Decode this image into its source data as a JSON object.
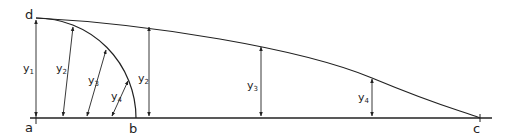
{
  "diagram": {
    "points": {
      "a": "a",
      "b": "b",
      "c": "c",
      "d": "d"
    },
    "ordinates": [
      {
        "base": "y",
        "sub": "1"
      },
      {
        "base": "y",
        "sub": "2"
      },
      {
        "base": "y",
        "sub": "3"
      },
      {
        "base": "y",
        "sub": "4"
      }
    ],
    "radial_ordinates": [
      {
        "base": "y",
        "sub": "2"
      },
      {
        "base": "y",
        "sub": "3"
      },
      {
        "base": "y",
        "sub": "4"
      }
    ],
    "line_color": "#222222",
    "background": "#ffffff"
  }
}
